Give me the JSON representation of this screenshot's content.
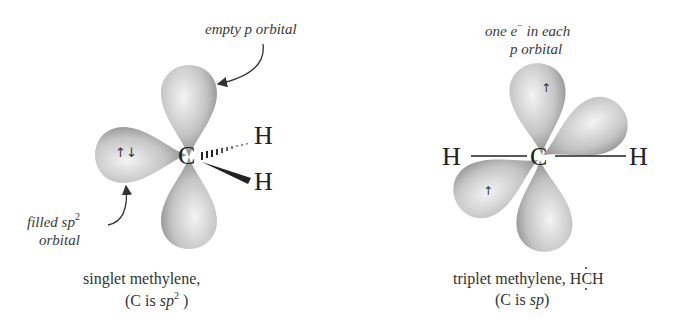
{
  "left_panel": {
    "title": "singlet methylene,",
    "hybridization_prefix": "(C is ",
    "hybridization_italic": "sp",
    "hybridization_sup": "2",
    "hybridization_suffix": " )",
    "annotation_top": "empty p orbital",
    "annotation_bottom_line1": "filled sp",
    "annotation_bottom_sup": "2",
    "annotation_bottom_line2": "orbital",
    "center_atom": "C",
    "h_upper": "H",
    "h_lower": "H",
    "electron_spins": "↑↓"
  },
  "right_panel": {
    "title": "triplet methylene, HĊH",
    "title_text": "triplet methylene, ",
    "formula_left": "H",
    "formula_center": "C",
    "formula_right": "H",
    "hybridization_prefix": "(C is ",
    "hybridization_italic": "sp",
    "hybridization_suffix": ")",
    "annotation_top_line1_a": "one e",
    "annotation_top_sup": "−",
    "annotation_top_line1_b": " in each",
    "annotation_top_line2": "p orbital",
    "center_atom": "C",
    "h_left": "H",
    "h_right": "H",
    "electron_upper": "↑",
    "electron_lower": "↑"
  },
  "colors": {
    "lobe_light": "#f2f2f2",
    "lobe_mid": "#b8b8b8",
    "lobe_dark": "#7d7d7d",
    "text": "#2a2a2a"
  }
}
